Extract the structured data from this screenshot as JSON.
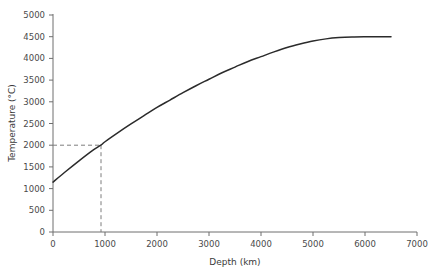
{
  "chart_data": {
    "type": "line",
    "title": "",
    "xlabel": "Depth (km)",
    "ylabel": "Temperature (°C)",
    "xlim": [
      0,
      7000
    ],
    "ylim": [
      0,
      5000
    ],
    "xticks": [
      0,
      1000,
      2000,
      3000,
      4000,
      5000,
      6000,
      7000
    ],
    "yticks": [
      0,
      500,
      1000,
      1500,
      2000,
      2500,
      3000,
      3500,
      4000,
      4500,
      5000
    ],
    "grid": false,
    "legend": "none",
    "series": [
      {
        "name": "Geotherm",
        "x": [
          0,
          250,
          500,
          750,
          920,
          1000,
          1250,
          1500,
          1750,
          2000,
          2250,
          2500,
          2750,
          3000,
          3250,
          3500,
          3750,
          4000,
          4250,
          4500,
          4750,
          5000,
          5250,
          5500,
          5750,
          6000,
          6250,
          6500
        ],
        "y": [
          1150,
          1400,
          1640,
          1870,
          2000,
          2080,
          2290,
          2490,
          2680,
          2870,
          3040,
          3210,
          3370,
          3520,
          3670,
          3800,
          3930,
          4040,
          4150,
          4250,
          4330,
          4400,
          4450,
          4480,
          4495,
          4500,
          4500,
          4500
        ]
      }
    ],
    "annotations": [
      {
        "name": "guide-2000C",
        "type": "dashed-guide",
        "x": 920,
        "y": 2000,
        "description": "Dashed lines marking 2000 °C at approximately 920 km depth"
      }
    ]
  },
  "axes": {
    "x_tick_labels": [
      "0",
      "1000",
      "2000",
      "3000",
      "4000",
      "5000",
      "6000",
      "7000"
    ],
    "y_tick_labels": [
      "0",
      "500",
      "1000",
      "1500",
      "2000",
      "2500",
      "3000",
      "3500",
      "4000",
      "4500",
      "5000"
    ],
    "x_title": "Depth (km)",
    "y_title": "Temperature (°C)"
  },
  "colors": {
    "curve": "#2b2b2b",
    "axis": "#6e6e6e",
    "guide": "#7d7d7d",
    "text": "#3a3a3a",
    "background": "#ffffff"
  }
}
